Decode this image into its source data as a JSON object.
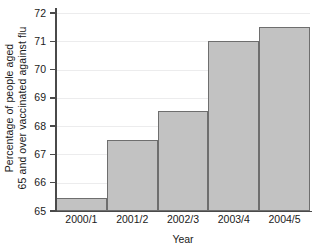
{
  "chart_data": {
    "type": "bar",
    "title": "",
    "xlabel": "Year",
    "ylabel_line1": "Percentage of people aged",
    "ylabel_line2": "65 and over vaccinated against flu",
    "categories": [
      "2000/1",
      "2001/2",
      "2002/3",
      "2003/4",
      "2004/5"
    ],
    "values": [
      65.45,
      67.5,
      68.55,
      71.0,
      71.5
    ],
    "ylim": [
      65,
      72
    ],
    "yticks": [
      65,
      66,
      67,
      68,
      69,
      70,
      71,
      72
    ],
    "ytick_labels": [
      "65",
      "66",
      "67",
      "68",
      "69",
      "70",
      "71",
      "72"
    ],
    "grid": true,
    "legend": "none",
    "bar_fill_color": "#c2c2c2",
    "bar_border_color": "#6e6e6e",
    "axis_color": "#4a4a4a",
    "gridline_color": "#ececed",
    "background_color": "#ffffff"
  }
}
